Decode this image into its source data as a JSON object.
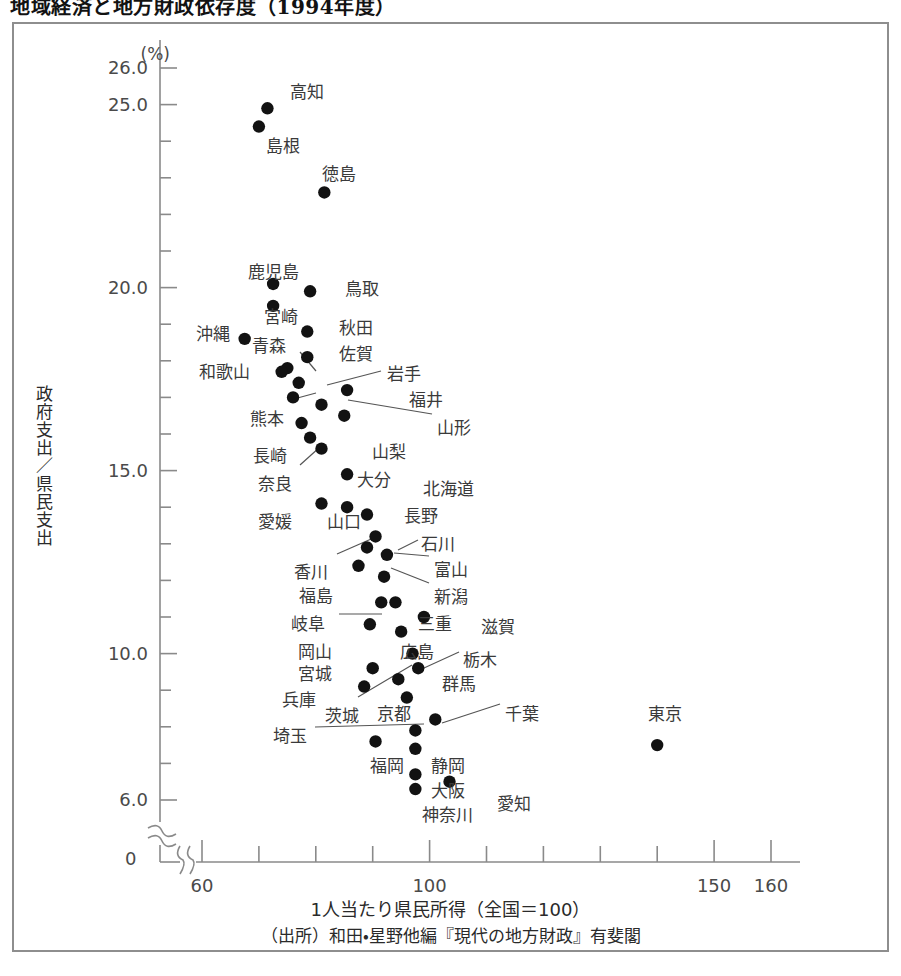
{
  "title": "地域経済と地方財政依存度（1994年度）",
  "axes": {
    "y_unit": "(%)",
    "y_axis_label": "政府支出／県民支出",
    "x_axis_label": "1人当たり県民所得（全国＝100）",
    "zero_label": "0",
    "y_tick_labels": [
      "26.0",
      "25.0",
      "20.0",
      "15.0",
      "10.0",
      "6.0"
    ],
    "x_tick_labels": [
      "60",
      "100",
      "150",
      "160"
    ]
  },
  "source": "（出所）和田・星野他編『現代の地方財政』有斐閣",
  "chart_data": {
    "type": "scatter",
    "title": "地域経済と地方財政依存度（1994年度）",
    "xlabel": "1人当たり県民所得（全国＝100）",
    "ylabel": "政府支出／県民支出 (%)",
    "xlim": [
      55,
      165
    ],
    "ylim": [
      5.5,
      26.5
    ],
    "grid": false,
    "legend": "none",
    "x_ticks_major": [
      60,
      100,
      150,
      160
    ],
    "x_ticks_all": [
      60,
      70,
      80,
      90,
      100,
      110,
      120,
      130,
      140,
      150,
      160
    ],
    "y_ticks_major": [
      26.0,
      25.0,
      20.0,
      15.0,
      10.0,
      6.0
    ],
    "y_ticks_all": [
      6.0,
      7.0,
      8.0,
      9.0,
      10.0,
      11.0,
      12.0,
      13.0,
      14.0,
      15.0,
      16.0,
      17.0,
      18.0,
      19.0,
      20.0,
      21.0,
      22.0,
      23.0,
      24.0,
      25.0,
      26.0
    ],
    "axis_break_y": true,
    "axis_break_x": true,
    "points": [
      {
        "label": "高知",
        "x": 71.5,
        "y": 24.9,
        "lx": 290,
        "ly": 78,
        "leader": false
      },
      {
        "label": "島根",
        "x": 70.0,
        "y": 24.4,
        "lx": 266,
        "ly": 132,
        "leader": false
      },
      {
        "label": "徳島",
        "x": 81.5,
        "y": 22.6,
        "lx": 322,
        "ly": 160,
        "leader": false
      },
      {
        "label": "鹿児島",
        "x": 72.5,
        "y": 20.1,
        "lx": 248,
        "ly": 258,
        "leader": false
      },
      {
        "label": "鳥取",
        "x": 79.0,
        "y": 19.9,
        "lx": 345,
        "ly": 275,
        "leader": false
      },
      {
        "label": "宮崎",
        "x": 72.5,
        "y": 19.5,
        "lx": 264,
        "ly": 303,
        "leader": false
      },
      {
        "label": "秋田",
        "x": 78.5,
        "y": 18.8,
        "lx": 339,
        "ly": 314,
        "leader": false
      },
      {
        "label": "沖縄",
        "x": 67.5,
        "y": 18.6,
        "lx": 196,
        "ly": 320,
        "leader": false
      },
      {
        "label": "青森",
        "x": 75.0,
        "y": 17.8,
        "lx": 252,
        "ly": 332,
        "leader": true,
        "l1x": 300,
        "l1y": 352,
        "l2x": 316,
        "l2y": 371
      },
      {
        "label": "佐賀",
        "x": 78.5,
        "y": 18.1,
        "lx": 339,
        "ly": 340,
        "leader": false
      },
      {
        "label": "和歌山",
        "x": 74.0,
        "y": 17.7,
        "lx": 199,
        "ly": 358,
        "leader": false
      },
      {
        "label": "岩手",
        "x": 77.0,
        "y": 17.4,
        "lx": 387,
        "ly": 360,
        "leader": true,
        "l1x": 381,
        "l1y": 371,
        "l2x": 327,
        "l2y": 385
      },
      {
        "label": "福井",
        "x": 85.5,
        "y": 17.2,
        "lx": 409,
        "ly": 386,
        "leader": false
      },
      {
        "label": "熊本",
        "x": 76.0,
        "y": 17.0,
        "lx": 250,
        "ly": 405,
        "leader": true,
        "l1x": 290,
        "l1y": 400,
        "l2x": 316,
        "l2y": 393
      },
      {
        "label": "山形",
        "x": 81.0,
        "y": 16.8,
        "lx": 437,
        "ly": 414,
        "leader": true,
        "l1x": 432,
        "l1y": 414,
        "l2x": 348,
        "l2y": 400
      },
      {
        "label": "山梨",
        "x": 85.0,
        "y": 16.5,
        "lx": 372,
        "ly": 438,
        "leader": false
      },
      {
        "label": "長崎",
        "x": 77.5,
        "y": 16.3,
        "lx": 253,
        "ly": 442,
        "leader": false
      },
      {
        "label": "奈良",
        "x": 79.0,
        "y": 15.9,
        "lx": 258,
        "ly": 470,
        "leader": true,
        "l1x": 300,
        "l1y": 465,
        "l2x": 320,
        "l2y": 447
      },
      {
        "label": "大分",
        "x": 81.0,
        "y": 15.6,
        "lx": 357,
        "ly": 466,
        "leader": false
      },
      {
        "label": "北海道",
        "x": 85.5,
        "y": 14.9,
        "lx": 423,
        "ly": 475,
        "leader": false
      },
      {
        "label": "愛媛",
        "x": 81.0,
        "y": 14.1,
        "lx": 258,
        "ly": 508,
        "leader": false
      },
      {
        "label": "山口",
        "x": 85.5,
        "y": 14.0,
        "lx": 327,
        "ly": 508,
        "leader": false
      },
      {
        "label": "長野",
        "x": 89.0,
        "y": 13.8,
        "lx": 404,
        "ly": 502,
        "leader": false
      },
      {
        "label": "石川",
        "x": 90.5,
        "y": 13.2,
        "lx": 421,
        "ly": 530,
        "leader": true,
        "l1x": 418,
        "l1y": 540,
        "l2x": 398,
        "l2y": 550
      },
      {
        "label": "香川",
        "x": 89.0,
        "y": 12.9,
        "lx": 294,
        "ly": 558,
        "leader": true,
        "l1x": 337,
        "l1y": 554,
        "l2x": 378,
        "l2y": 536
      },
      {
        "label": "富山",
        "x": 92.5,
        "y": 12.7,
        "lx": 434,
        "ly": 556,
        "leader": true,
        "l1x": 429,
        "l1y": 556,
        "l2x": 394,
        "l2y": 553
      },
      {
        "label": "福島",
        "x": 87.5,
        "y": 12.4,
        "lx": 299,
        "ly": 582,
        "leader": false
      },
      {
        "label": "新潟",
        "x": 92.0,
        "y": 12.1,
        "lx": 434,
        "ly": 583,
        "leader": true,
        "l1x": 429,
        "l1y": 583,
        "l2x": 391,
        "l2y": 568
      },
      {
        "label": "岐阜",
        "x": 91.5,
        "y": 11.4,
        "lx": 291,
        "ly": 610,
        "leader": true,
        "l1x": 339,
        "l1y": 614,
        "l2x": 382,
        "l2y": 614
      },
      {
        "label": "三重",
        "x": 94.0,
        "y": 11.4,
        "lx": 418,
        "ly": 610,
        "leader": false
      },
      {
        "label": "滋賀",
        "x": 99.0,
        "y": 11.0,
        "lx": 481,
        "ly": 613,
        "leader": false
      },
      {
        "label": "岡山",
        "x": 89.5,
        "y": 10.8,
        "lx": 298,
        "ly": 638,
        "leader": false
      },
      {
        "label": "広島",
        "x": 95.0,
        "y": 10.6,
        "lx": 400,
        "ly": 638,
        "leader": false
      },
      {
        "label": "栃木",
        "x": 97.0,
        "y": 10.0,
        "lx": 463,
        "ly": 646,
        "leader": true,
        "l1x": 459,
        "l1y": 652,
        "l2x": 424,
        "l2y": 668
      },
      {
        "label": "宮城",
        "x": 90.0,
        "y": 9.6,
        "lx": 298,
        "ly": 660,
        "leader": false
      },
      {
        "label": "群馬",
        "x": 98.0,
        "y": 9.6,
        "lx": 442,
        "ly": 670,
        "leader": false
      },
      {
        "label": "兵庫",
        "x": 88.5,
        "y": 9.1,
        "lx": 282,
        "ly": 686,
        "leader": false
      },
      {
        "label": "茨城",
        "x": 94.5,
        "y": 9.3,
        "lx": 325,
        "ly": 702,
        "leader": true,
        "l1x": 358,
        "l1y": 697,
        "l2x": 412,
        "l2y": 665
      },
      {
        "label": "京都",
        "x": 96.0,
        "y": 8.8,
        "lx": 377,
        "ly": 700,
        "leader": false
      },
      {
        "label": "千葉",
        "x": 101.0,
        "y": 8.2,
        "lx": 505,
        "ly": 700,
        "leader": true,
        "l1x": 500,
        "l1y": 704,
        "l2x": 442,
        "l2y": 723
      },
      {
        "label": "埼玉",
        "x": 97.5,
        "y": 7.9,
        "lx": 273,
        "ly": 722,
        "leader": true,
        "l1x": 315,
        "l1y": 727,
        "l2x": 424,
        "l2y": 724
      },
      {
        "label": "福岡",
        "x": 90.5,
        "y": 7.6,
        "lx": 370,
        "ly": 752,
        "leader": false
      },
      {
        "label": "静岡",
        "x": 97.5,
        "y": 7.4,
        "lx": 431,
        "ly": 752,
        "leader": false
      },
      {
        "label": "大阪",
        "x": 97.5,
        "y": 6.7,
        "lx": 431,
        "ly": 777,
        "leader": false
      },
      {
        "label": "神奈川",
        "x": 97.5,
        "y": 6.3,
        "lx": 422,
        "ly": 801,
        "leader": false
      },
      {
        "label": "愛知",
        "x": 103.5,
        "y": 6.5,
        "lx": 497,
        "ly": 790,
        "leader": false
      },
      {
        "label": "東京",
        "x": 140.0,
        "y": 7.5,
        "lx": 648,
        "ly": 700,
        "leader": false
      }
    ]
  }
}
